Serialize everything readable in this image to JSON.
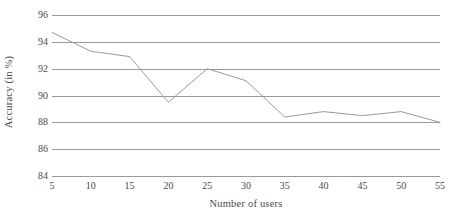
{
  "chart_data": {
    "type": "line",
    "title": "",
    "xlabel": "Number of users",
    "ylabel": "Accuracy (in %)",
    "x": [
      5,
      10,
      15,
      20,
      25,
      30,
      35,
      40,
      45,
      50,
      55
    ],
    "xticklabels": [
      "5",
      "10",
      "15",
      "20",
      "25",
      "30",
      "35",
      "40",
      "45",
      "50",
      "55"
    ],
    "yticklabels": [
      "84",
      "86",
      "88",
      "90",
      "92",
      "94",
      "96"
    ],
    "yticks": [
      84,
      86,
      88,
      90,
      92,
      94,
      96
    ],
    "xlim": [
      5,
      55
    ],
    "ylim": [
      84,
      96
    ],
    "grid": true,
    "legend": "none",
    "series": [
      {
        "name": "Accuracy",
        "color": "#9a9a9a",
        "values": [
          94.7,
          93.3,
          92.9,
          89.5,
          92.0,
          91.1,
          88.4,
          88.8,
          88.5,
          88.8,
          88.0
        ]
      }
    ]
  },
  "axes": {
    "y_title": "Accuracy (in %)",
    "x_title": "Number of users"
  },
  "style": {
    "gridline_color": "#9a9a9a",
    "line_color": "#9a9a9a",
    "text_color": "#4a4a4a",
    "background": "#ffffff"
  }
}
